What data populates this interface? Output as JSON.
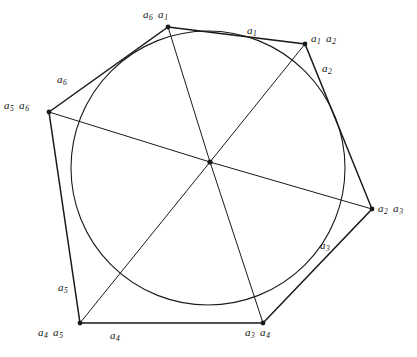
{
  "figure": {
    "background": "#ffffff",
    "stroke_color": "#1a1a1a",
    "width": 417,
    "height": 357,
    "center_point": {
      "x": 210,
      "y": 162,
      "label": "center-dot"
    },
    "circle": {
      "cx": 208,
      "cy": 168,
      "r": 137
    },
    "polygon_vertices": [
      {
        "name": "a6a1",
        "x": 168,
        "y": 27
      },
      {
        "name": "a1a2",
        "x": 305,
        "y": 44
      },
      {
        "name": "a2a3",
        "x": 372,
        "y": 209
      },
      {
        "name": "a3a4",
        "x": 263,
        "y": 323
      },
      {
        "name": "a4a5",
        "x": 80,
        "y": 323
      },
      {
        "name": "a5a6",
        "x": 49,
        "y": 112
      }
    ],
    "vertex_labels": [
      {
        "id": "vertex-label-a6-a1",
        "left": 143,
        "top": 9,
        "parts": [
          "a",
          "6",
          "a",
          "1"
        ]
      },
      {
        "id": "vertex-label-a1-a2",
        "left": 311,
        "top": 33,
        "parts": [
          "a",
          "1",
          "a",
          "2"
        ]
      },
      {
        "id": "vertex-label-a2-a3",
        "left": 378,
        "top": 203,
        "parts": [
          "a",
          "2",
          "a",
          "3"
        ]
      },
      {
        "id": "vertex-label-a3-a4",
        "left": 245,
        "top": 327,
        "parts": [
          "a",
          "3",
          "a",
          "4"
        ]
      },
      {
        "id": "vertex-label-a4-a5",
        "left": 38,
        "top": 327,
        "parts": [
          "a",
          "4",
          "a",
          "5"
        ]
      },
      {
        "id": "vertex-label-a5-a6",
        "left": 4,
        "top": 100,
        "parts": [
          "a",
          "5",
          "a",
          "6"
        ]
      }
    ],
    "edge_labels": [
      {
        "id": "edge-label-a1",
        "left": 247,
        "top": 25,
        "letter": "a",
        "index": "1"
      },
      {
        "id": "edge-label-a2",
        "left": 322,
        "top": 63,
        "letter": "a",
        "index": "2"
      },
      {
        "id": "edge-label-a3",
        "left": 320,
        "top": 240,
        "letter": "a",
        "index": "3"
      },
      {
        "id": "edge-label-a4",
        "left": 110,
        "top": 330,
        "letter": "a",
        "index": "4"
      },
      {
        "id": "edge-label-a5",
        "left": 58,
        "top": 282,
        "letter": "a",
        "index": "5"
      },
      {
        "id": "edge-label-a6",
        "left": 57,
        "top": 74,
        "letter": "a",
        "index": "6"
      }
    ]
  }
}
